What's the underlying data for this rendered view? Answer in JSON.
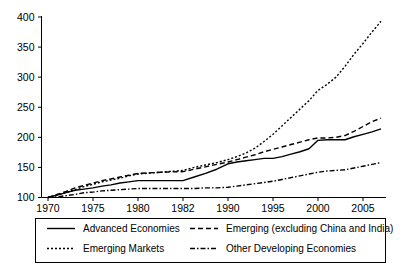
{
  "chart_data": {
    "type": "line",
    "title": "",
    "subtitle": "",
    "xlabel": "",
    "ylabel": "",
    "grid": false,
    "legend_position": "bottom",
    "x_tick_labels": [
      "1970",
      "1975",
      "1980",
      "1982",
      "1990",
      "1995",
      "2000",
      "2005"
    ],
    "y_tick_labels": [
      "100",
      "150",
      "200",
      "250",
      "300",
      "350",
      "400"
    ],
    "ylim": [
      100,
      400
    ],
    "x_axis_note": "ticks evenly spaced although year intervals are irregular",
    "series": [
      {
        "name": "Advanced Economies",
        "style": "solid",
        "x": [
          1970,
          1971,
          1972,
          1973,
          1974,
          1975,
          1976,
          1977,
          1978,
          1979,
          1980,
          1981,
          1982,
          1984,
          1986,
          1988,
          1990,
          1991,
          1992,
          1993,
          1994,
          1995,
          1996,
          1997,
          1998,
          1999,
          2000,
          2001,
          2002,
          2003,
          2004,
          2005,
          2006,
          2007
        ],
        "values": [
          100,
          104,
          108,
          112,
          114,
          116,
          119,
          121,
          124,
          126,
          128,
          128,
          128,
          134,
          140,
          147,
          156,
          159,
          161,
          163,
          165,
          165,
          168,
          172,
          176,
          181,
          195,
          196,
          196,
          196,
          201,
          205,
          209,
          214
        ]
      },
      {
        "name": "Emerging (excluding China and India)",
        "style": "dashed",
        "x": [
          1970,
          1971,
          1972,
          1973,
          1974,
          1975,
          1976,
          1977,
          1978,
          1979,
          1980,
          1981,
          1982,
          1984,
          1986,
          1988,
          1990,
          1991,
          1992,
          1993,
          1994,
          1995,
          1996,
          1997,
          1998,
          1999,
          2000,
          2001,
          2002,
          2003,
          2004,
          2005,
          2006,
          2007
        ],
        "values": [
          100,
          105,
          110,
          116,
          120,
          124,
          128,
          131,
          134,
          137,
          140,
          142,
          143,
          147,
          151,
          155,
          159,
          163,
          167,
          171,
          176,
          180,
          184,
          188,
          192,
          196,
          199,
          199,
          200,
          203,
          210,
          218,
          226,
          232
        ]
      },
      {
        "name": "Emerging Markets",
        "style": "dotted",
        "x": [
          1970,
          1971,
          1972,
          1973,
          1974,
          1975,
          1976,
          1977,
          1978,
          1979,
          1980,
          1981,
          1982,
          1984,
          1986,
          1988,
          1990,
          1991,
          1992,
          1993,
          1994,
          1995,
          1996,
          1997,
          1998,
          1999,
          2000,
          2001,
          2002,
          2003,
          2004,
          2005,
          2006,
          2007
        ],
        "values": [
          100,
          104,
          108,
          113,
          118,
          122,
          126,
          129,
          132,
          136,
          139,
          142,
          145,
          150,
          154,
          158,
          163,
          168,
          174,
          182,
          193,
          205,
          219,
          233,
          247,
          261,
          278,
          288,
          300,
          318,
          338,
          356,
          375,
          393
        ]
      },
      {
        "name": "Other Developing Economies",
        "style": "dash-dot",
        "x": [
          1970,
          1971,
          1972,
          1973,
          1974,
          1975,
          1976,
          1977,
          1978,
          1979,
          1980,
          1981,
          1982,
          1984,
          1986,
          1988,
          1990,
          1991,
          1992,
          1993,
          1994,
          1995,
          1996,
          1997,
          1998,
          1999,
          2000,
          2001,
          2002,
          2003,
          2004,
          2005,
          2006,
          2007
        ],
        "values": [
          100,
          101,
          103,
          105,
          108,
          109,
          111,
          112,
          113,
          114,
          115,
          115,
          115,
          115,
          116,
          116,
          117,
          119,
          121,
          123,
          125,
          127,
          130,
          133,
          136,
          139,
          142,
          144,
          145,
          146,
          149,
          152,
          155,
          158
        ]
      }
    ],
    "legend": [
      {
        "label": "Advanced Economies",
        "style": "solid"
      },
      {
        "label": "Emerging (excluding China and India)",
        "style": "dashed"
      },
      {
        "label": "Emerging Markets",
        "style": "dotted"
      },
      {
        "label": "Other Developing Economies",
        "style": "dash-dot"
      }
    ]
  }
}
